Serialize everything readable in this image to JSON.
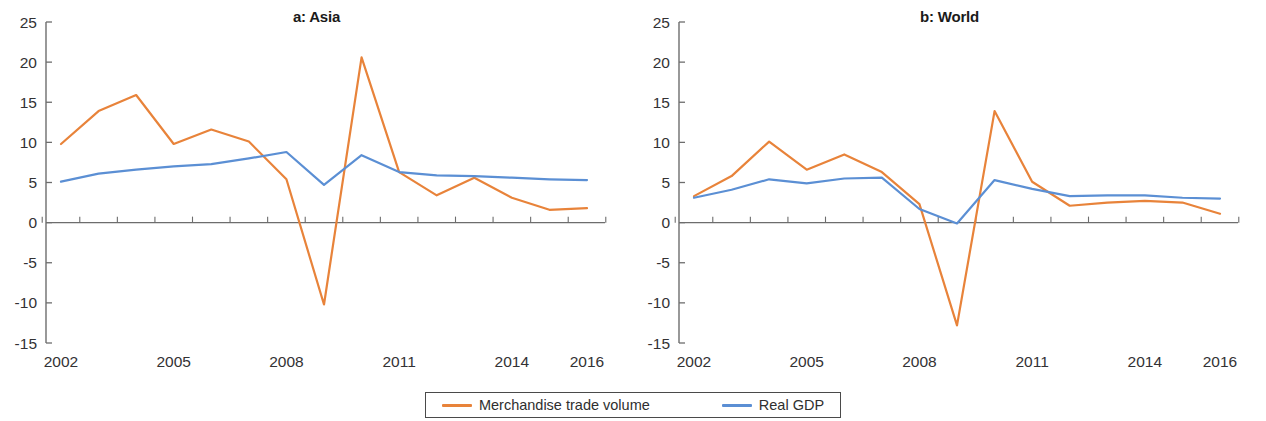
{
  "figure": {
    "background": "#ffffff",
    "series_colors": {
      "merchandise_trade_volume": "#E8833A",
      "real_gdp": "#5B8FD4"
    },
    "axis_color": "#6d6d6d"
  },
  "legend": {
    "items": [
      {
        "label": "Merchandise trade volume",
        "color": "#E8833A"
      },
      {
        "label": "Real GDP",
        "color": "#5B8FD4"
      }
    ]
  },
  "panels": [
    {
      "id": "panel-a-asia",
      "title": "a: Asia",
      "ytick_labels": [
        "25",
        "20",
        "15",
        "10",
        "5",
        "0",
        "-5",
        "-10",
        "-15"
      ],
      "xtick_labels": [
        "2002",
        "2005",
        "2008",
        "2011",
        "2014",
        "2016"
      ]
    },
    {
      "id": "panel-b-world",
      "title": "b: World",
      "ytick_labels": [
        "25",
        "20",
        "15",
        "10",
        "5",
        "0",
        "-5",
        "-10",
        "-15"
      ],
      "xtick_labels": [
        "2002",
        "2005",
        "2008",
        "2011",
        "2014",
        "2016"
      ]
    }
  ],
  "chart_data": [
    {
      "type": "line",
      "title": "a: Asia",
      "xlabel": "",
      "ylabel": "",
      "x": [
        2002,
        2003,
        2004,
        2005,
        2006,
        2007,
        2008,
        2009,
        2010,
        2011,
        2012,
        2013,
        2014,
        2015,
        2016
      ],
      "xtick_labels": [
        "2002",
        "2005",
        "2008",
        "2011",
        "2014",
        "2016"
      ],
      "xticks": [
        2002,
        2005,
        2008,
        2011,
        2014,
        2016
      ],
      "ylim": [
        -15,
        25
      ],
      "yticks": [
        -15,
        -10,
        -5,
        0,
        5,
        10,
        15,
        20,
        25
      ],
      "grid": false,
      "legend_position": "bottom-center",
      "series": [
        {
          "name": "Merchandise trade volume",
          "color": "#E8833A",
          "values": [
            9.8,
            13.9,
            15.9,
            9.8,
            11.6,
            10.1,
            5.4,
            -10.2,
            20.6,
            6.3,
            3.4,
            5.6,
            3.1,
            1.6,
            1.8
          ]
        },
        {
          "name": "Real GDP",
          "color": "#5B8FD4",
          "values": [
            5.1,
            6.1,
            6.6,
            7.0,
            7.3,
            8.0,
            8.8,
            4.7,
            8.4,
            6.3,
            5.9,
            5.8,
            5.6,
            5.4,
            5.3
          ]
        }
      ]
    },
    {
      "type": "line",
      "title": "b: World",
      "xlabel": "",
      "ylabel": "",
      "x": [
        2002,
        2003,
        2004,
        2005,
        2006,
        2007,
        2008,
        2009,
        2010,
        2011,
        2012,
        2013,
        2014,
        2015,
        2016
      ],
      "xtick_labels": [
        "2002",
        "2005",
        "2008",
        "2011",
        "2014",
        "2016"
      ],
      "xticks": [
        2002,
        2005,
        2008,
        2011,
        2014,
        2016
      ],
      "ylim": [
        -15,
        25
      ],
      "yticks": [
        -15,
        -10,
        -5,
        0,
        5,
        10,
        15,
        20,
        25
      ],
      "grid": false,
      "legend_position": "bottom-center",
      "series": [
        {
          "name": "Merchandise trade volume",
          "color": "#E8833A",
          "values": [
            3.3,
            5.8,
            10.1,
            6.6,
            8.5,
            6.3,
            2.3,
            -12.8,
            13.9,
            5.1,
            2.1,
            2.5,
            2.7,
            2.5,
            1.1
          ]
        },
        {
          "name": "Real GDP",
          "color": "#5B8FD4",
          "values": [
            3.1,
            4.1,
            5.4,
            4.9,
            5.5,
            5.6,
            1.7,
            -0.1,
            5.3,
            4.2,
            3.3,
            3.4,
            3.4,
            3.1,
            3.0
          ]
        }
      ]
    }
  ]
}
